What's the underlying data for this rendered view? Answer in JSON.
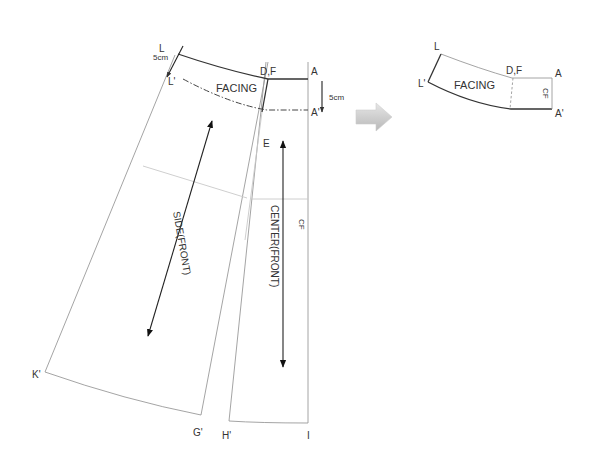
{
  "diagram": {
    "left_pattern": {
      "points": {
        "L": "L",
        "L_prime": "L'",
        "DF": "D,F",
        "A": "A",
        "A_prime": "A'",
        "E": "E",
        "K_prime": "K'",
        "G_prime": "G'",
        "H_prime": "H'",
        "I": "I"
      },
      "measure_left": "5cm",
      "measure_right": "5cm",
      "facing_label": "FACING",
      "side_label": "SIDE(FRONT)",
      "center_label": "CENTER(FRONT)",
      "cf_label": "CF"
    },
    "arrow": {
      "icon": "right-arrow-icon",
      "color": "#c8c8c8"
    },
    "right_piece": {
      "points": {
        "L": "L",
        "L_prime": "L'",
        "DF": "D,F",
        "A": "A",
        "A_prime": "A'"
      },
      "facing_label": "FACING",
      "cf_label": "CF"
    }
  }
}
